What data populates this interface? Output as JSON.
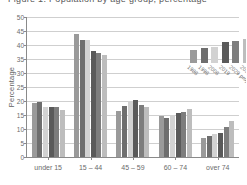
{
  "title": "Figure 1: Population by age group, percentage",
  "chart_data": {
    "type": "bar",
    "title": "Population by age group, percentage",
    "xlabel": "",
    "ylabel": "Percentage",
    "ylim": [
      0,
      50
    ],
    "yticks": [
      0,
      5,
      10,
      15,
      20,
      25,
      30,
      35,
      40,
      45,
      50
    ],
    "grid": true,
    "legend_position": "inside-top-right",
    "categories": [
      "under 15",
      "15 – 44",
      "45 – 59",
      "60 – 74",
      "over 74"
    ],
    "series": [
      {
        "name": "1986",
        "color": "#9a9a9a",
        "values": [
          19.2,
          44.1,
          16.5,
          14.5,
          6.9
        ]
      },
      {
        "name": "1996",
        "color": "#6e6e6e",
        "values": [
          19.5,
          41.9,
          18.2,
          13.8,
          7.5
        ]
      },
      {
        "name": "2006",
        "color": "#d2d2d2",
        "values": [
          17.9,
          41.7,
          19.9,
          15.0,
          8.1
        ]
      },
      {
        "name": "2019",
        "color": "#5a5a5a",
        "values": [
          17.9,
          38.0,
          20.4,
          15.6,
          8.6
        ]
      },
      {
        "name": "2029 projected",
        "color": "#7d7d7d",
        "values": [
          17.7,
          37.2,
          18.5,
          16.2,
          10.7
        ]
      },
      {
        "name": "2039 projected",
        "color": "#bdbdbd",
        "values": [
          16.8,
          36.5,
          18.0,
          17.1,
          12.8
        ]
      }
    ],
    "legend_swatch_heights": [
      13,
      15,
      16,
      21,
      22,
      24
    ]
  }
}
